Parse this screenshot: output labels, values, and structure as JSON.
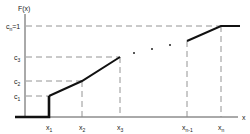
{
  "diagram": {
    "y_axis_label": "F(x)",
    "x_axis_label": "x",
    "y_levels": [
      {
        "id": "cn",
        "label_main": "c",
        "label_sub": "n",
        "label_suffix": "=1"
      },
      {
        "id": "c3",
        "label_main": "c",
        "label_sub": "3",
        "label_suffix": ""
      },
      {
        "id": "c2",
        "label_main": "c",
        "label_sub": "2",
        "label_suffix": ""
      },
      {
        "id": "c1",
        "label_main": "c",
        "label_sub": "1",
        "label_suffix": ""
      }
    ],
    "x_ticks": [
      {
        "id": "x1",
        "label_main": "x",
        "label_sub": "1"
      },
      {
        "id": "x2",
        "label_main": "x",
        "label_sub": "2"
      },
      {
        "id": "x3",
        "label_main": "x",
        "label_sub": "3"
      },
      {
        "id": "xn1",
        "label_main": "x",
        "label_sub": "n-1"
      },
      {
        "id": "xn",
        "label_main": "x",
        "label_sub": "n"
      }
    ],
    "ellipsis": "· · ·",
    "points": [
      {
        "x": "x1",
        "F": "c1"
      },
      {
        "x": "x2",
        "F": "c2"
      },
      {
        "x": "x3",
        "F": "c3"
      },
      {
        "x": "xn-1",
        "F": "cn-1"
      },
      {
        "x": "xn",
        "F": "cn=1"
      }
    ]
  }
}
